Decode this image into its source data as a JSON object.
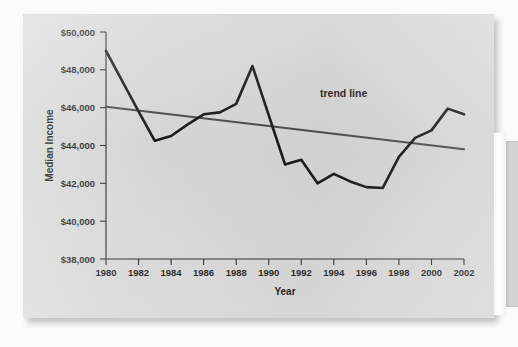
{
  "figure": {
    "background_color": "#d9d9d9",
    "page_color": "#fbfbfb"
  },
  "chart_data": {
    "type": "line",
    "title": "",
    "xlabel": "Year",
    "ylabel": "Median Income",
    "xlim": [
      1980,
      2002
    ],
    "ylim": [
      38000,
      50000
    ],
    "grid": false,
    "legend_position": "inline-annotation",
    "x_tick_labels": [
      "1980",
      "1982",
      "1984",
      "1986",
      "1988",
      "1990",
      "1992",
      "1994",
      "1996",
      "1998",
      "2000",
      "2002"
    ],
    "x_ticks": [
      1980,
      1982,
      1984,
      1986,
      1988,
      1990,
      1992,
      1994,
      1996,
      1998,
      2000,
      2002
    ],
    "y_tick_labels": [
      "$50,000",
      "$48,000",
      "$46,000",
      "$44,000",
      "$42,000",
      "$40,000",
      "$38,000"
    ],
    "y_ticks": [
      50000,
      48000,
      46000,
      44000,
      42000,
      40000,
      38000
    ],
    "x": [
      1980,
      1981,
      1982,
      1983,
      1984,
      1985,
      1986,
      1987,
      1988,
      1989,
      1990,
      1991,
      1992,
      1993,
      1994,
      1995,
      1996,
      1997,
      1998,
      1999,
      2000,
      2001,
      2002
    ],
    "series": [
      {
        "name": "Median Income",
        "color": "#1a1a1a",
        "values": [
          49000,
          47400,
          45800,
          44250,
          44500,
          45100,
          45650,
          45750,
          46200,
          48200,
          45600,
          43000,
          43250,
          42000,
          42500,
          42100,
          41800,
          41750,
          43400,
          44400,
          44800,
          45950,
          45650
        ]
      },
      {
        "name": "trend line",
        "color": "#4b4b4b",
        "values": [
          46050,
          45950,
          45850,
          45750,
          45650,
          45550,
          45450,
          45350,
          45250,
          45150,
          45050,
          44950,
          44850,
          44750,
          44650,
          44550,
          44450,
          44350,
          44250,
          44150,
          44050,
          43950,
          43800
        ]
      }
    ],
    "annotations": [
      {
        "text": "trend line",
        "x": 1994,
        "y": 45300
      }
    ]
  }
}
